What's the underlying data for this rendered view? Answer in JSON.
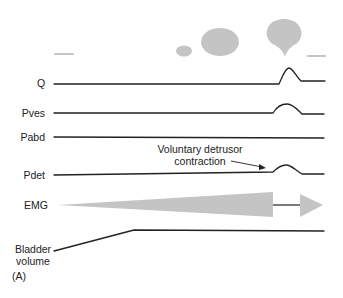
{
  "figure": {
    "panel_label": "(A)",
    "fill_color": "#c4c4c4",
    "line_color": "#222222",
    "traces": [
      {
        "id": "q",
        "label": "Q"
      },
      {
        "id": "pves",
        "label": "Pves"
      },
      {
        "id": "pabd",
        "label": "Pabd"
      },
      {
        "id": "pdet",
        "label": "Pdet"
      },
      {
        "id": "emg",
        "label": "EMG"
      },
      {
        "id": "bladder",
        "label_line1": "Bladder",
        "label_line2": "volume"
      }
    ],
    "annotation": {
      "line1": "Voluntary detrusor",
      "line2": "contraction"
    }
  }
}
